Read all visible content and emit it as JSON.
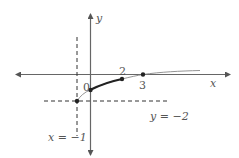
{
  "diagram": {
    "type": "function-graph",
    "axes": {
      "x_label": "x",
      "y_label": "y",
      "origin_label": "0"
    },
    "asymptotes": {
      "vertical": {
        "label": "x = −1",
        "value": -1
      },
      "horizontal": {
        "label": "y = −2",
        "value": -2
      }
    },
    "tick_labels": {
      "two": "2",
      "three": "3"
    },
    "points": [
      {
        "name": "start-point",
        "x": -1,
        "y": -2
      },
      {
        "name": "y-intercept",
        "x": 0,
        "y": -1
      },
      {
        "name": "highlight-end",
        "x": 2,
        "y": -0.4
      },
      {
        "name": "x-intercept",
        "x": 3,
        "y": 0
      }
    ],
    "colors": {
      "axis": "#555555",
      "curve": "#333333",
      "curve_thin": "#888888",
      "dashed": "#333333",
      "text": "#555555"
    }
  }
}
